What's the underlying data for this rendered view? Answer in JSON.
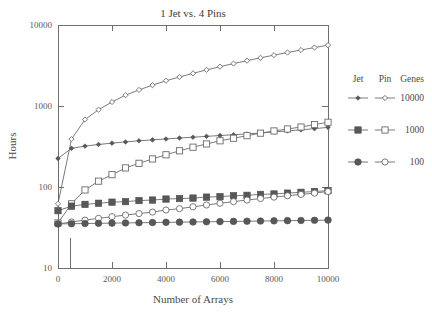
{
  "chart_data": {
    "type": "line",
    "title": "1 Jet vs. 4 Pins",
    "xlabel": "Number of Arrays",
    "ylabel": "Hours",
    "xlim": [
      0,
      10000
    ],
    "ylim": [
      10,
      10000
    ],
    "yscale": "log",
    "xscale": "linear",
    "grid": false,
    "xticks": [
      0,
      2000,
      4000,
      6000,
      8000,
      10000
    ],
    "xticklabels": [
      "0",
      "2000",
      "4000",
      "6000",
      "8000",
      "10000"
    ],
    "yticks": [
      10,
      100,
      1000,
      10000
    ],
    "yticklabels": [
      "10",
      "100",
      "1000",
      "10000"
    ],
    "legend_position": "right",
    "legend_headers": [
      "Jet",
      "Pin",
      "Genes"
    ],
    "legend_groups": [
      "10000",
      "1000",
      "100"
    ],
    "x": [
      0,
      500,
      1000,
      1500,
      2000,
      2500,
      3000,
      3500,
      4000,
      4500,
      5000,
      5500,
      6000,
      6500,
      7000,
      7500,
      8000,
      8500,
      9000,
      9500,
      10000
    ],
    "series": [
      {
        "name": "Pin 10000",
        "device": "Pin",
        "genes": "10000",
        "marker": "diamond-open",
        "values": [
          62,
          390,
          680,
          900,
          1120,
          1360,
          1580,
          1810,
          2050,
          2280,
          2530,
          2790,
          3060,
          3340,
          3630,
          3930,
          4250,
          4570,
          4910,
          5270,
          5640
        ]
      },
      {
        "name": "Jet 10000",
        "device": "Jet",
        "genes": "10000",
        "marker": "diamond-filled",
        "values": [
          225,
          300,
          320,
          335,
          348,
          360,
          372,
          382,
          392,
          402,
          412,
          422,
          432,
          442,
          452,
          464,
          478,
          492,
          508,
          525,
          545
        ]
      },
      {
        "name": "Pin 1000",
        "device": "Pin",
        "genes": "1000",
        "marker": "square-open",
        "values": [
          36,
          62,
          92,
          118,
          142,
          172,
          196,
          222,
          250,
          280,
          310,
          340,
          372,
          400,
          430,
          462,
          492,
          520,
          550,
          590,
          630
        ]
      },
      {
        "name": "Jet 1000",
        "device": "Jet",
        "genes": "1000",
        "marker": "square-filled",
        "values": [
          51,
          58,
          61,
          63,
          65,
          66,
          68,
          69,
          71,
          72,
          73,
          75,
          76,
          78,
          79,
          81,
          82,
          84,
          86,
          88,
          90
        ]
      },
      {
        "name": "Pin 100",
        "device": "Pin",
        "genes": "100",
        "marker": "circle-open",
        "values": [
          35,
          37,
          39,
          41,
          43,
          45,
          47,
          49,
          52,
          54,
          57,
          60,
          63,
          66,
          69,
          72,
          75,
          78,
          81,
          84,
          88
        ]
      },
      {
        "name": "Jet 100",
        "device": "Jet",
        "genes": "100",
        "marker": "circle-filled",
        "values": [
          35,
          35.2,
          35.4,
          35.6,
          35.8,
          36,
          36.2,
          36.4,
          36.6,
          36.8,
          37,
          37.2,
          37.4,
          37.6,
          37.8,
          38,
          38.2,
          38.4,
          38.6,
          38.8,
          39
        ]
      }
    ],
    "colors": {
      "line": "#6b6b6b",
      "marker_fill": "#58585c",
      "marker_open_fill": "#ffffff",
      "axis": "#6e6e6e",
      "text": "#4a4a4a",
      "background": "#ffffff"
    }
  }
}
